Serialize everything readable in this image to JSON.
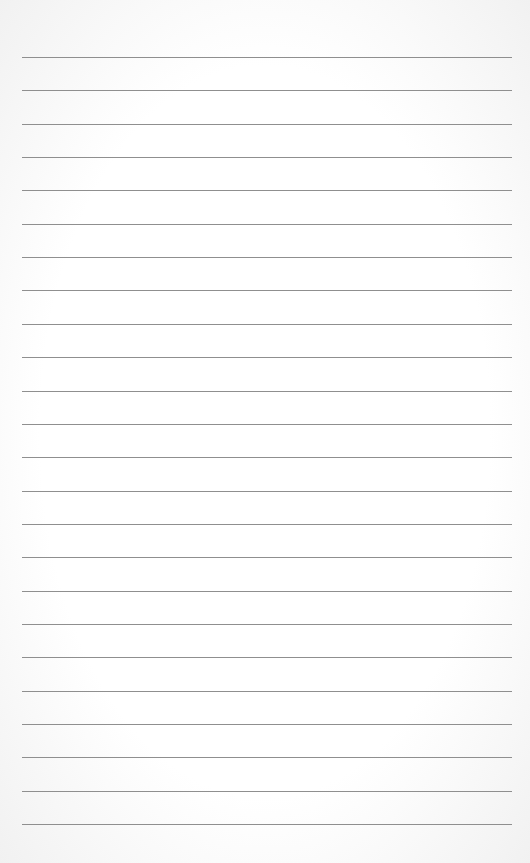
{
  "paper": {
    "type": "lined-paper",
    "background_color": "#ffffff",
    "line_color": "#8f8f8f",
    "line_count": 24,
    "first_line_y": 57,
    "line_spacing": 33.35,
    "line_left": 22,
    "line_width": 490
  }
}
